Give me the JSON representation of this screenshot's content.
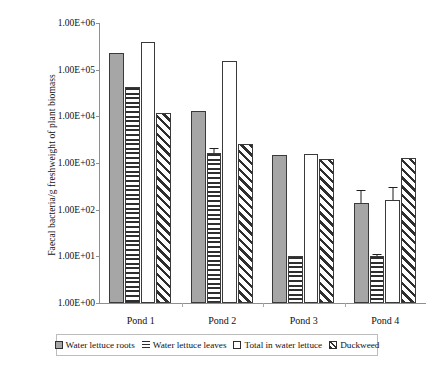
{
  "chart_data": {
    "type": "bar",
    "title": "",
    "xlabel": "",
    "ylabel": "Faecal bacteria/g freshweight of plant biomass",
    "yscale": "log",
    "ylim": [
      1,
      1000000
    ],
    "ytick_labels": [
      "1.00E+06",
      "1.00E+05",
      "1.00E+04",
      "1.00E+03",
      "1.00E+02",
      "1.00E+01",
      "1.00E+00"
    ],
    "ytick_values": [
      1000000,
      100000,
      10000,
      1000,
      100,
      10,
      1
    ],
    "grid": false,
    "legend_position": "bottom",
    "categories": [
      "Pond 1",
      "Pond 2",
      "Pond 3",
      "Pond 4"
    ],
    "series": [
      {
        "name": "Water lettuce roots",
        "fill": "solid-gray",
        "color": "#a6a6a6",
        "values": [
          230000,
          13000,
          1500,
          140
        ],
        "errors_high": [
          null,
          null,
          null,
          260
        ]
      },
      {
        "name": "Water lettuce leaves",
        "fill": "horizontal-stripes",
        "color": "#2e2e2e",
        "values": [
          42000,
          1600,
          10,
          10
        ],
        "errors_high": [
          null,
          2100,
          null,
          11
        ]
      },
      {
        "name": "Total in water lettuce",
        "fill": "white",
        "color": "#ffffff",
        "values": [
          390000,
          150000,
          1550,
          160
        ],
        "errors_high": [
          null,
          null,
          null,
          300
        ]
      },
      {
        "name": "Duckweed",
        "fill": "diagonal-hatch",
        "color": "#2e2e2e",
        "values": [
          12000,
          2500,
          1200,
          1300
        ],
        "errors_high": [
          null,
          null,
          null,
          null
        ]
      }
    ]
  },
  "axis": {
    "y_title": "Faecal bacteria/g freshweight of plant biomass"
  },
  "legend": {
    "items": [
      {
        "label": "Water lettuce roots"
      },
      {
        "label": "Water lettuce leaves"
      },
      {
        "label": "Total in water lettuce"
      },
      {
        "label": "Duckweed"
      }
    ]
  }
}
